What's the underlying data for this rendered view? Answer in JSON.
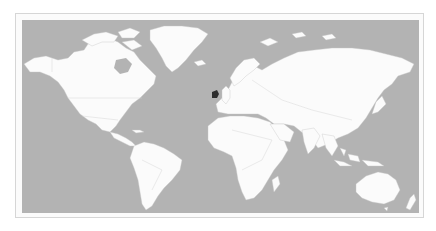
{
  "map": {
    "type": "world-political-outline",
    "projection": "equirectangular-like",
    "highlighted_country": "Ireland",
    "colors": {
      "ocean": "#b3b3b3",
      "land": "#fbfbfb",
      "border": "#c4c4c4",
      "highlight": "#2e2e2e",
      "frame": "#d6d6d6"
    },
    "continents": [
      "North America",
      "South America",
      "Greenland",
      "Europe",
      "Africa",
      "Asia",
      "Australia",
      "New Zealand"
    ]
  }
}
